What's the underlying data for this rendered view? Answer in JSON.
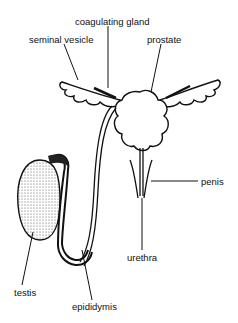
{
  "diagram": {
    "labels": {
      "coagulating_gland": "coagulating gland",
      "seminal_vesicle": "seminal vesicle",
      "prostate": "prostate",
      "penis": "penis",
      "urethra": "urethra",
      "testis": "testis",
      "epididymis": "epididymis"
    },
    "colors": {
      "ink": "#111111",
      "background": "#ffffff"
    }
  }
}
